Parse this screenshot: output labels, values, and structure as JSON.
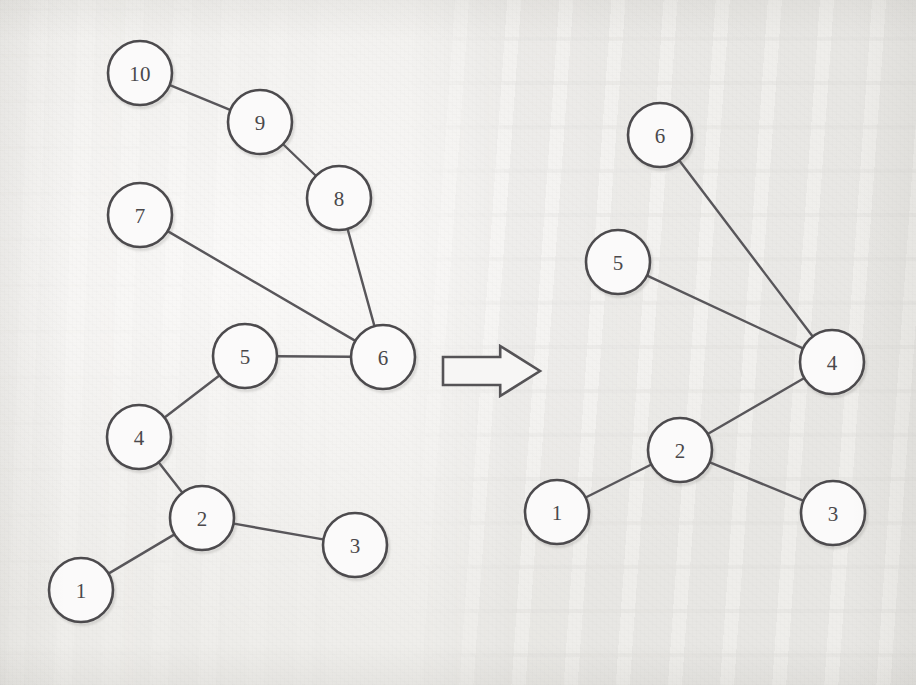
{
  "figure": {
    "kind": "graph-transformation-diagram",
    "background_color": "#f3f2f0",
    "ink_color": "#4c4a4d",
    "node_fill_color": "#fbfafa",
    "node_radius": 32,
    "arrow": {
      "name": "transformation-arrow",
      "direction": "right",
      "style": "hollow-block-arrow",
      "x": 443,
      "y": 346,
      "width": 97,
      "height": 50
    }
  },
  "graphs": [
    {
      "id": "before",
      "name": "original-graph",
      "node_count": 10,
      "nodes": [
        {
          "id": "L10",
          "label": "10",
          "cx": 140,
          "cy": 73
        },
        {
          "id": "L9",
          "label": "9",
          "cx": 260,
          "cy": 122
        },
        {
          "id": "L8",
          "label": "8",
          "cx": 339,
          "cy": 198
        },
        {
          "id": "L7",
          "label": "7",
          "cx": 140,
          "cy": 215
        },
        {
          "id": "L6",
          "label": "6",
          "cx": 383,
          "cy": 357
        },
        {
          "id": "L5",
          "label": "5",
          "cx": 245,
          "cy": 356
        },
        {
          "id": "L4",
          "label": "4",
          "cx": 139,
          "cy": 437
        },
        {
          "id": "L2",
          "label": "2",
          "cx": 202,
          "cy": 518
        },
        {
          "id": "L3",
          "label": "3",
          "cx": 355,
          "cy": 545
        },
        {
          "id": "L1",
          "label": "1",
          "cx": 81,
          "cy": 590
        }
      ],
      "edges": [
        {
          "from": "L10",
          "to": "L9"
        },
        {
          "from": "L9",
          "to": "L8"
        },
        {
          "from": "L8",
          "to": "L6"
        },
        {
          "from": "L7",
          "to": "L6"
        },
        {
          "from": "L6",
          "to": "L5"
        },
        {
          "from": "L5",
          "to": "L4"
        },
        {
          "from": "L4",
          "to": "L2"
        },
        {
          "from": "L2",
          "to": "L3"
        },
        {
          "from": "L2",
          "to": "L1"
        }
      ]
    },
    {
      "id": "after",
      "name": "transformed-graph",
      "node_count": 6,
      "nodes": [
        {
          "id": "R6",
          "label": "6",
          "cx": 660,
          "cy": 135
        },
        {
          "id": "R5",
          "label": "5",
          "cx": 618,
          "cy": 262
        },
        {
          "id": "R4",
          "label": "4",
          "cx": 832,
          "cy": 362
        },
        {
          "id": "R2",
          "label": "2",
          "cx": 680,
          "cy": 450
        },
        {
          "id": "R1",
          "label": "1",
          "cx": 557,
          "cy": 512
        },
        {
          "id": "R3",
          "label": "3",
          "cx": 833,
          "cy": 513
        }
      ],
      "edges": [
        {
          "from": "R6",
          "to": "R4"
        },
        {
          "from": "R5",
          "to": "R4"
        },
        {
          "from": "R4",
          "to": "R2"
        },
        {
          "from": "R2",
          "to": "R1"
        },
        {
          "from": "R2",
          "to": "R3"
        }
      ]
    }
  ]
}
